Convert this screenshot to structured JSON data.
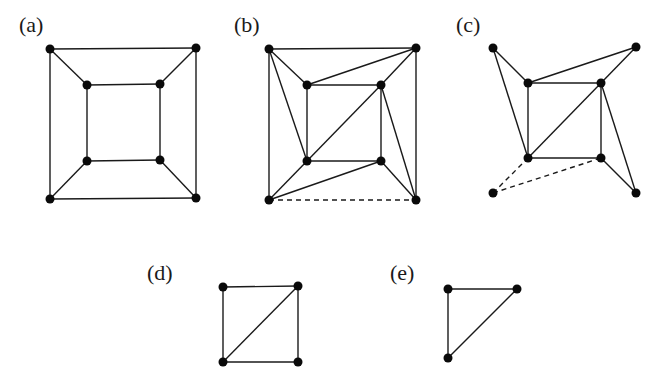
{
  "figure": {
    "colors": {
      "line": "#1a1a1a",
      "node": "#0a0a0a",
      "background": "#ffffff"
    },
    "panels": [
      {
        "id": "a",
        "label": "(a)",
        "label_pos": [
          19,
          14
        ],
        "nodes": [
          [
            50,
            49
          ],
          [
            196,
            48
          ],
          [
            50,
            199
          ],
          [
            196,
            198
          ],
          [
            87,
            85
          ],
          [
            160,
            84
          ],
          [
            87,
            161
          ],
          [
            160,
            160
          ]
        ],
        "edges": [
          [
            0,
            1
          ],
          [
            0,
            2
          ],
          [
            1,
            3
          ],
          [
            2,
            3
          ],
          [
            4,
            5
          ],
          [
            4,
            6
          ],
          [
            5,
            7
          ],
          [
            6,
            7
          ],
          [
            0,
            4
          ],
          [
            1,
            5
          ],
          [
            2,
            6
          ],
          [
            3,
            7
          ]
        ],
        "dashed_edges": []
      },
      {
        "id": "b",
        "label": "(b)",
        "label_pos": [
          234,
          14
        ],
        "nodes": [
          [
            269,
            49
          ],
          [
            416,
            48
          ],
          [
            269,
            200
          ],
          [
            416,
            200
          ],
          [
            307,
            85
          ],
          [
            381,
            85
          ],
          [
            307,
            161
          ],
          [
            381,
            161
          ]
        ],
        "edges": [
          [
            0,
            1
          ],
          [
            0,
            2
          ],
          [
            1,
            3
          ],
          [
            4,
            5
          ],
          [
            4,
            6
          ],
          [
            5,
            7
          ],
          [
            6,
            7
          ],
          [
            0,
            4
          ],
          [
            1,
            5
          ],
          [
            2,
            6
          ],
          [
            3,
            7
          ],
          [
            0,
            6
          ],
          [
            1,
            4
          ],
          [
            2,
            7
          ],
          [
            3,
            5
          ],
          [
            6,
            5
          ]
        ],
        "dashed_edges": [
          [
            2,
            3
          ]
        ]
      },
      {
        "id": "c",
        "label": "(c)",
        "label_pos": [
          456,
          14
        ],
        "nodes": [
          [
            493,
            48
          ],
          [
            636,
            47
          ],
          [
            493,
            193
          ],
          [
            636,
            193
          ],
          [
            528,
            83
          ],
          [
            601,
            83
          ],
          [
            528,
            158
          ],
          [
            601,
            158
          ]
        ],
        "edges": [
          [
            4,
            5
          ],
          [
            4,
            6
          ],
          [
            5,
            7
          ],
          [
            6,
            7
          ],
          [
            0,
            4
          ],
          [
            1,
            5
          ],
          [
            3,
            7
          ],
          [
            0,
            6
          ],
          [
            1,
            4
          ],
          [
            3,
            5
          ],
          [
            6,
            5
          ]
        ],
        "dashed_edges": [
          [
            2,
            6
          ],
          [
            2,
            7
          ]
        ]
      },
      {
        "id": "d",
        "label": "(d)",
        "label_pos": [
          147,
          262
        ],
        "nodes": [
          [
            223,
            287
          ],
          [
            298,
            286
          ],
          [
            223,
            362
          ],
          [
            298,
            362
          ]
        ],
        "edges": [
          [
            0,
            1
          ],
          [
            0,
            2
          ],
          [
            1,
            3
          ],
          [
            2,
            3
          ],
          [
            2,
            1
          ]
        ],
        "dashed_edges": []
      },
      {
        "id": "e",
        "label": "(e)",
        "label_pos": [
          390,
          262
        ],
        "nodes": [
          [
            448,
            289
          ],
          [
            517,
            289
          ],
          [
            448,
            358
          ]
        ],
        "edges": [
          [
            0,
            1
          ],
          [
            0,
            2
          ],
          [
            2,
            1
          ]
        ],
        "dashed_edges": []
      }
    ]
  }
}
